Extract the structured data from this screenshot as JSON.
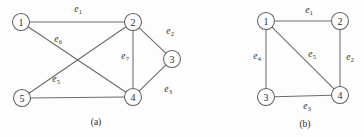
{
  "figure": {
    "background_color": "#fdfdfd",
    "line_color": "#6b6b6b",
    "vertex_stroke_color": "#5e5e5e",
    "text_color": "#2b2b2b"
  },
  "panels": [
    {
      "id": "panel-a",
      "caption": "(a)",
      "caption_pos": {
        "x": 96,
        "y": 122
      },
      "vertices": [
        {
          "id": "a1",
          "label": "1",
          "x": 21,
          "y": 22,
          "r": 8.5
        },
        {
          "id": "a2",
          "label": "2",
          "x": 133,
          "y": 22,
          "r": 8.5
        },
        {
          "id": "a3",
          "label": "3",
          "x": 172,
          "y": 59,
          "r": 8.5
        },
        {
          "id": "a4",
          "label": "4",
          "x": 133,
          "y": 97,
          "r": 8.5
        },
        {
          "id": "a5",
          "label": "5",
          "x": 22,
          "y": 98,
          "r": 8.5
        }
      ],
      "edges": [
        {
          "id": "e1",
          "from": "a1",
          "to": "a2",
          "label": "e",
          "sub": "1",
          "label_pos": {
            "x": 78,
            "y": 10
          }
        },
        {
          "id": "e2",
          "from": "a2",
          "to": "a3",
          "label": "e",
          "sub": "2",
          "label_pos": {
            "x": 170,
            "y": 32
          }
        },
        {
          "id": "e3",
          "from": "a3",
          "to": "a4",
          "label": "e",
          "sub": "3",
          "label_pos": {
            "x": 168,
            "y": 90
          }
        },
        {
          "id": "e7",
          "from": "a2",
          "to": "a4",
          "label": "e",
          "sub": "7",
          "label_pos": {
            "x": 125,
            "y": 57
          }
        },
        {
          "id": "e6",
          "from": "a1",
          "to": "a4",
          "label": "e",
          "sub": "6",
          "label_pos": {
            "x": 58,
            "y": 40
          }
        },
        {
          "id": "e5",
          "from": "a5",
          "to": "a2",
          "label": "e",
          "sub": "5",
          "label_pos": {
            "x": 56,
            "y": 80
          }
        },
        {
          "id": "e8",
          "from": "a5",
          "to": "a4",
          "label": "",
          "sub": "",
          "label_pos": null
        }
      ]
    },
    {
      "id": "panel-b",
      "caption": "(b)",
      "caption_pos": {
        "x": 305,
        "y": 124
      },
      "vertices": [
        {
          "id": "b1",
          "label": "1",
          "x": 266,
          "y": 21,
          "r": 8.5
        },
        {
          "id": "b2",
          "label": "2",
          "x": 340,
          "y": 21,
          "r": 8.5
        },
        {
          "id": "b3",
          "label": "3",
          "x": 266,
          "y": 97,
          "r": 8.5
        },
        {
          "id": "b4",
          "label": "4",
          "x": 340,
          "y": 95,
          "r": 8.5
        }
      ],
      "edges": [
        {
          "id": "be1",
          "from": "b1",
          "to": "b2",
          "label": "e",
          "sub": "1",
          "label_pos": {
            "x": 309,
            "y": 11
          }
        },
        {
          "id": "be2",
          "from": "b2",
          "to": "b4",
          "label": "e",
          "sub": "2",
          "label_pos": {
            "x": 350,
            "y": 58
          }
        },
        {
          "id": "be3",
          "from": "b3",
          "to": "b4",
          "label": "e",
          "sub": "3",
          "label_pos": {
            "x": 307,
            "y": 107
          }
        },
        {
          "id": "be4",
          "from": "b1",
          "to": "b3",
          "label": "e",
          "sub": "4",
          "label_pos": {
            "x": 257,
            "y": 57
          }
        },
        {
          "id": "be5",
          "from": "b1",
          "to": "b4",
          "label": "e",
          "sub": "5",
          "label_pos": {
            "x": 312,
            "y": 55
          }
        }
      ]
    }
  ]
}
